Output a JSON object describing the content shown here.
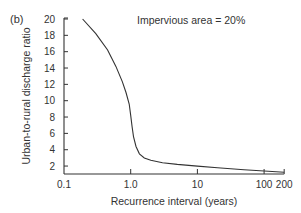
{
  "panel_label": "(b)",
  "chart_data": {
    "type": "line",
    "title": "",
    "annotation": "Impervious area = 20%",
    "xlabel": "Recurrence interval (years)",
    "ylabel": "Urban-to-rural discharge ratio",
    "xscale": "log",
    "xlim": [
      0.1,
      200
    ],
    "ylim": [
      1,
      20
    ],
    "x_ticks": [
      0.1,
      1,
      10,
      100,
      200
    ],
    "x_tick_labels": [
      "0.1",
      "1.0",
      "10",
      "100",
      "200"
    ],
    "y_ticks": [
      2,
      4,
      6,
      8,
      10,
      12,
      14,
      16,
      18,
      20
    ],
    "y_tick_labels": [
      "2",
      "4",
      "6",
      "8",
      "10",
      "12",
      "14",
      "16",
      "18",
      "20"
    ],
    "grid": false,
    "legend": null,
    "series": [
      {
        "name": "Impervious area = 20%",
        "x": [
          0.19,
          0.3,
          0.45,
          0.6,
          0.75,
          0.85,
          0.95,
          1.0,
          1.05,
          1.1,
          1.2,
          1.35,
          1.6,
          2.0,
          3.0,
          5.0,
          10,
          20,
          50,
          100,
          200
        ],
        "y": [
          20.0,
          18.2,
          16.2,
          14.2,
          12.3,
          11.0,
          9.6,
          8.2,
          6.8,
          5.6,
          4.4,
          3.5,
          3.0,
          2.7,
          2.4,
          2.2,
          2.0,
          1.8,
          1.55,
          1.4,
          1.25
        ]
      }
    ]
  }
}
